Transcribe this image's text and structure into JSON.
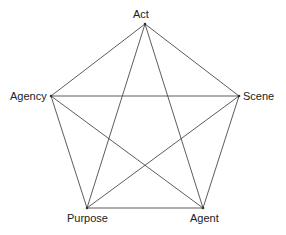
{
  "diagram": {
    "type": "pentagon-with-diagonals",
    "colors": {
      "line": "#4a4a4a",
      "text": "#222222",
      "background": "#ffffff"
    },
    "nodes": [
      {
        "id": "act",
        "label": "Act",
        "x": 145,
        "y": 24,
        "label_x": 133,
        "label_y": 9
      },
      {
        "id": "scene",
        "label": "Scene",
        "x": 239,
        "y": 96,
        "label_x": 243,
        "label_y": 91
      },
      {
        "id": "agent",
        "label": "Agent",
        "x": 203,
        "y": 208,
        "label_x": 190,
        "label_y": 213
      },
      {
        "id": "purpose",
        "label": "Purpose",
        "x": 87,
        "y": 208,
        "label_x": 67,
        "label_y": 213
      },
      {
        "id": "agency",
        "label": "Agency",
        "x": 51,
        "y": 96,
        "label_x": 10,
        "label_y": 91
      }
    ],
    "edges": [
      [
        "act",
        "scene"
      ],
      [
        "scene",
        "agent"
      ],
      [
        "agent",
        "purpose"
      ],
      [
        "purpose",
        "agency"
      ],
      [
        "agency",
        "act"
      ],
      [
        "act",
        "agent"
      ],
      [
        "act",
        "purpose"
      ],
      [
        "agency",
        "scene"
      ],
      [
        "agency",
        "agent"
      ],
      [
        "scene",
        "purpose"
      ]
    ]
  }
}
